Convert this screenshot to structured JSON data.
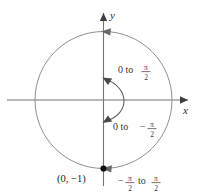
{
  "figure": {
    "type": "unit-circle-angle-diagram",
    "axes": {
      "x_label": "x",
      "y_label": "y"
    },
    "point": {
      "label": "(0, −1)",
      "x": 0,
      "y": -1
    },
    "annotations": {
      "upper_arc": {
        "prefix": "0 to",
        "sign": "",
        "numerator": "π",
        "denominator": "2"
      },
      "lower_arc": {
        "prefix": "0 to",
        "sign": "−",
        "numerator": "π",
        "denominator": "2"
      },
      "full_arc": {
        "sign": "−",
        "numerator1": "π",
        "denominator1": "2",
        "middle": "to",
        "numerator2": "π",
        "denominator2": "2"
      }
    },
    "colors": {
      "axis": "#6e6e6e",
      "circle": "#8a8a8a",
      "arc": "#555555",
      "point": "#111111",
      "text": "#2b2b2b"
    }
  }
}
